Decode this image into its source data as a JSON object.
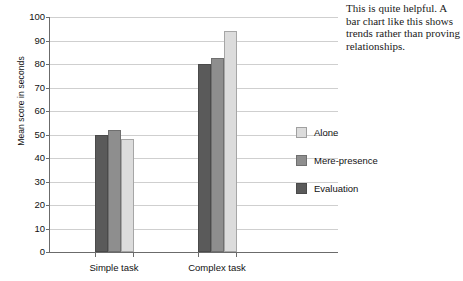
{
  "chart_data": {
    "type": "bar",
    "title": "",
    "xlabel": "",
    "ylabel": "Mean score in seconds",
    "ylim": [
      0,
      100
    ],
    "yticks": [
      0,
      10,
      20,
      30,
      40,
      50,
      60,
      70,
      80,
      90,
      100
    ],
    "grid": true,
    "legend_position": "right",
    "categories": [
      "Simple task",
      "Complex task"
    ],
    "series": [
      {
        "name": "Evaluation",
        "values": [
          50,
          80
        ],
        "color": "#5a5a5a"
      },
      {
        "name": "Mere-presence",
        "values": [
          52,
          82.5
        ],
        "color": "#8e8e8e"
      },
      {
        "name": "Alone",
        "values": [
          48,
          94
        ],
        "color": "#dcdcdc"
      }
    ],
    "legend_order": [
      "Alone",
      "Mere-presence",
      "Evaluation"
    ]
  },
  "annotation": {
    "text": "This is quite helpful. A bar chart like this shows trends rather than proving relationships."
  }
}
